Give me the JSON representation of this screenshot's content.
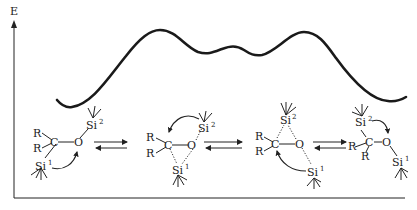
{
  "figure": {
    "axis": {
      "y_label": "E",
      "x_label": ""
    },
    "energy_curve": {
      "description": "Reaction energy profile: reactant minimum, high TS, shallow intermediate double-well, second high TS, product minimum",
      "points": [
        {
          "x": 57,
          "y": 100
        },
        {
          "x": 70,
          "y": 107
        },
        {
          "x": 158,
          "y": 30
        },
        {
          "x": 200,
          "y": 53
        },
        {
          "x": 237,
          "y": 47
        },
        {
          "x": 262,
          "y": 56
        },
        {
          "x": 307,
          "y": 32
        },
        {
          "x": 390,
          "y": 101
        },
        {
          "x": 406,
          "y": 97
        }
      ]
    },
    "structures": [
      {
        "name": "reactant",
        "atoms": {
          "r1": "R",
          "r2": "R",
          "c": "C",
          "o": "O",
          "si_a": "Si",
          "si_a_sup": "2",
          "si_b": "Si",
          "si_b_sup": "1"
        }
      },
      {
        "name": "intermediate-1",
        "atoms": {
          "r1": "R",
          "r2": "R",
          "c": "C",
          "o": "O",
          "si_a": "Si",
          "si_a_sup": "2",
          "si_b": "Si",
          "si_b_sup": "1"
        }
      },
      {
        "name": "intermediate-2",
        "atoms": {
          "r1": "R",
          "r2": "R",
          "c": "C",
          "o": "O",
          "si_a": "Si",
          "si_a_sup": "2",
          "si_b": "Si",
          "si_b_sup": "1"
        }
      },
      {
        "name": "product",
        "atoms": {
          "r1": "R",
          "r2": "R",
          "c": "C",
          "o": "O",
          "si_a": "Si",
          "si_a_sup": "2",
          "si_b": "Si",
          "si_b_sup": "1"
        }
      }
    ],
    "equilibrium_arrows": 3
  }
}
